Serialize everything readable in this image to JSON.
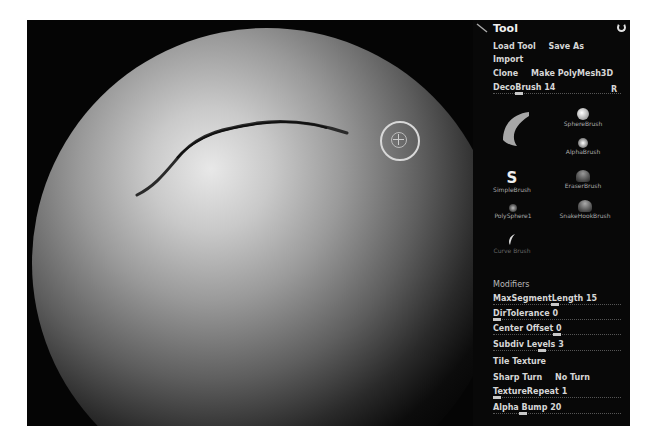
{
  "panel": {
    "title": "Tool",
    "buttons_row1": [
      "Load Tool",
      "Save As"
    ],
    "import_label": "Import",
    "buttons_row3": [
      "Clone",
      "Make PolyMesh3D"
    ],
    "current_tool": {
      "label": "DecoBrush",
      "value": "14"
    },
    "r_label": "R"
  },
  "brushes": [
    {
      "name": "DecoBrush",
      "label": ""
    },
    {
      "name": "SphereBrush",
      "label": "SphereBrush"
    },
    {
      "name": "AlphaBrush",
      "label": "AlphaBrush"
    },
    {
      "name": "SimpleBrush",
      "label": "SimpleBrush"
    },
    {
      "name": "EraserBrush",
      "label": "EraserBrush"
    },
    {
      "name": "PolySphere1",
      "label": "PolySphere1"
    },
    {
      "name": "SnakeHookBrush",
      "label": "SnakeHookBrush"
    },
    {
      "name": "CurveBrush",
      "label": "Curve Brush"
    }
  ],
  "modifiers": {
    "section_label": "Modifiers",
    "items": [
      {
        "label": "MaxSegmentLength",
        "value": "15",
        "knob": 0.5
      },
      {
        "label": "DirTolerance",
        "value": "0",
        "knob": 0.0
      },
      {
        "label": "Center Offset",
        "value": "0",
        "knob": 0.5
      },
      {
        "label": "Subdiv Levels",
        "value": "3",
        "knob": 0.4
      }
    ],
    "tile_texture": "Tile Texture",
    "sharp_turn": [
      "Sharp Turn",
      "No Turn"
    ],
    "texture_repeat": {
      "label": "TextureRepeat",
      "value": "1",
      "knob": 0.0
    },
    "alpha_bump": {
      "label": "Alpha Bump",
      "value": "20",
      "knob": 0.2
    }
  }
}
